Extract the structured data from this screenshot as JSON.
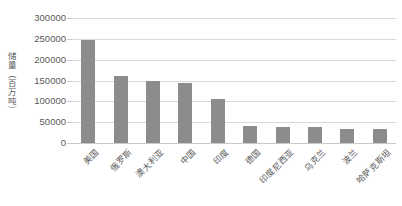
{
  "chart_data": {
    "type": "bar",
    "title": "",
    "xlabel": "",
    "ylabel": "储量（百万吨）",
    "categories": [
      "美国",
      "俄罗斯",
      "澳大利亚",
      "中国",
      "印度",
      "德国",
      "印度尼西亚",
      "乌克兰",
      "波兰",
      "哈萨克斯坦"
    ],
    "values": [
      248000,
      162000,
      150000,
      143000,
      106000,
      40000,
      39000,
      38000,
      34000,
      34000
    ],
    "ylim": [
      0,
      300000
    ],
    "ytick_labels": [
      "300000",
      "250000",
      "200000",
      "150000",
      "100000",
      "50000",
      "0"
    ],
    "ytick_values": [
      300000,
      250000,
      200000,
      150000,
      100000,
      50000,
      0
    ],
    "grid": true,
    "legend": "none",
    "bar_color": "#8c8c8c",
    "gridline_color": "#d9d9d9",
    "background_color": "#ffffff",
    "text_color": "#5a5a5a"
  }
}
